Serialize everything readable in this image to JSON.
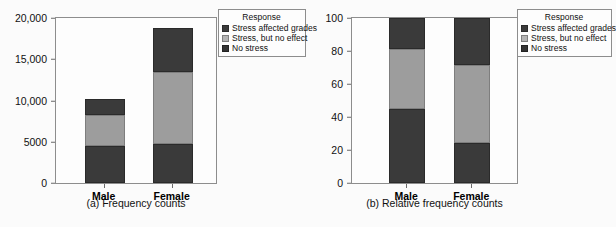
{
  "figure": {
    "background": "#fbfbfb",
    "colors": {
      "stress_affected_grades": "#3a3a3a",
      "stress_no_effect": "#9d9d9d",
      "no_stress": "#3a3a3a",
      "axis": "#8d8d8d",
      "text": "#111111"
    }
  },
  "legend": {
    "title": "Response",
    "items": [
      {
        "label": "Stress affected grades",
        "swatch": "dark"
      },
      {
        "label": "Stress, but no effect",
        "swatch": "gray"
      },
      {
        "label": "No stress",
        "swatch": "black"
      }
    ]
  },
  "panel_a": {
    "caption": "(a) Frequency counts",
    "yticks": [
      "20,000",
      "15,000",
      "10,000",
      "5000",
      "0"
    ],
    "xlabels": [
      "Male",
      "Female"
    ]
  },
  "panel_b": {
    "caption": "(b) Relative frequency counts",
    "yticks": [
      "100",
      "80",
      "60",
      "40",
      "20",
      "0"
    ],
    "xlabels": [
      "Male",
      "Female"
    ]
  },
  "chart_data": [
    {
      "type": "bar",
      "subtype": "stacked",
      "title": "(a) Frequency counts",
      "xlabel": "",
      "ylabel": "",
      "categories": [
        "Male",
        "Female"
      ],
      "ylim": [
        0,
        20000
      ],
      "yticks": [
        0,
        5000,
        10000,
        15000,
        20000
      ],
      "ytick_labels": [
        "0",
        "5000",
        "10,000",
        "15,000",
        "20,000"
      ],
      "grid": false,
      "legend": {
        "title": "Response",
        "position": "upper-right-outside"
      },
      "series": [
        {
          "name": "No stress",
          "values": [
            4500,
            4700
          ],
          "color": "#3a3a3a"
        },
        {
          "name": "Stress, but no effect",
          "values": [
            3700,
            8700
          ],
          "color": "#9d9d9d"
        },
        {
          "name": "Stress affected grades",
          "values": [
            2000,
            5400
          ],
          "color": "#3a3a3a"
        }
      ],
      "totals": [
        10200,
        18800
      ]
    },
    {
      "type": "bar",
      "subtype": "stacked",
      "title": "(b) Relative frequency counts",
      "xlabel": "",
      "ylabel": "",
      "categories": [
        "Male",
        "Female"
      ],
      "ylim": [
        0,
        100
      ],
      "yticks": [
        0,
        20,
        40,
        60,
        80,
        100
      ],
      "ytick_labels": [
        "0",
        "20",
        "40",
        "60",
        "80",
        "100"
      ],
      "grid": false,
      "legend": {
        "title": "Response",
        "position": "upper-right-outside"
      },
      "series": [
        {
          "name": "No stress",
          "values": [
            45.0,
            24.5
          ],
          "color": "#3a3a3a"
        },
        {
          "name": "Stress, but no effect",
          "values": [
            36.0,
            47.0
          ],
          "color": "#9d9d9d"
        },
        {
          "name": "Stress affected grades",
          "values": [
            19.0,
            28.5
          ],
          "color": "#3a3a3a"
        }
      ],
      "totals": [
        100,
        100
      ]
    }
  ]
}
